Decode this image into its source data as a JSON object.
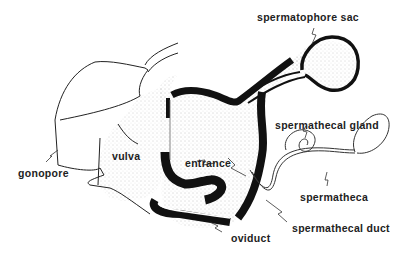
{
  "figure": {
    "type": "anatomical line drawing",
    "colors": {
      "ink": "#111111",
      "stipple": "#444444",
      "background": "#ffffff"
    }
  },
  "labels": {
    "spermatophore_sac": "spermatophore sac",
    "spermathecal_gland": "spermathecal gland",
    "vulva": "vulva",
    "entrance": "entrance",
    "gonopore": "gonopore",
    "spermatheca": "spermatheca",
    "spermathecal_duct": "spermathecal duct",
    "oviduct": "oviduct"
  }
}
